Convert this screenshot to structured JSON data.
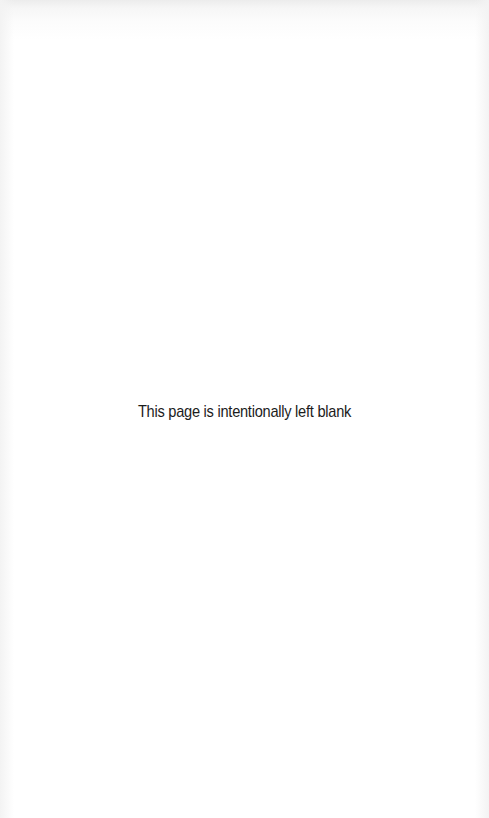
{
  "page": {
    "notice": "This page is intentionally left blank"
  }
}
